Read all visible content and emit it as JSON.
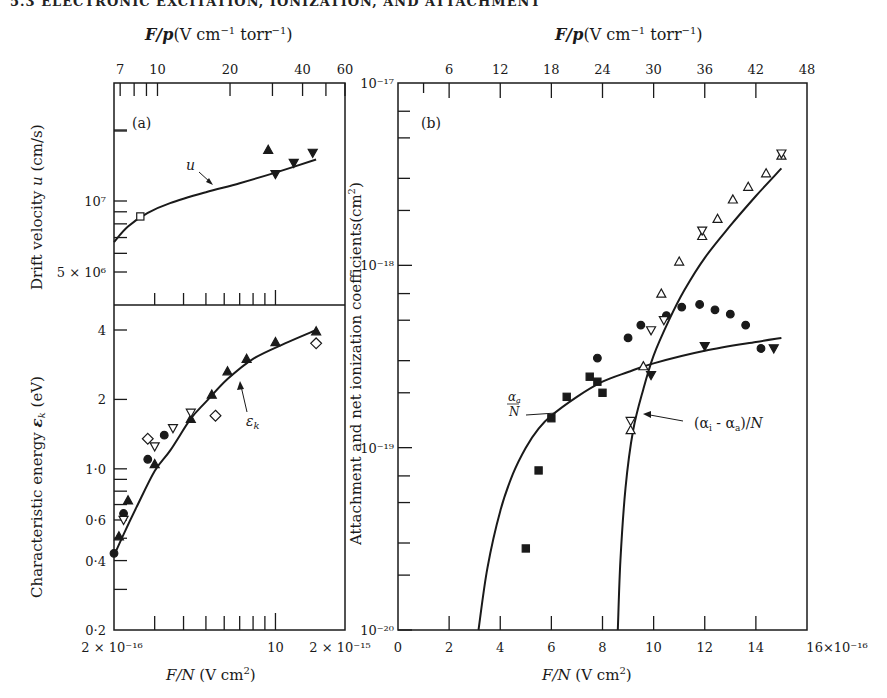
{
  "page": {
    "header_text": "5.3 ELECTRONIC EXCITATION, IONIZATION, AND ATTACHMENT"
  },
  "chart_data": [
    {
      "panel": "a-top",
      "type": "scatter",
      "label": "(a)",
      "title": "",
      "top_xlabel": "F/p (V cm⁻¹ torr⁻¹)",
      "top_xticks": [
        "7",
        "10",
        "20",
        "40",
        "60"
      ],
      "xlabel": "F/N (V cm²)",
      "xscale": "log",
      "xlim": [
        2e-16,
        2e-15
      ],
      "ylabel": "Drift velocity u (cm/s)",
      "yscale": "log",
      "yticks": [
        "5×10⁶",
        "10⁷"
      ],
      "curve_label": "u",
      "curve": {
        "name": "u",
        "x": [
          2e-16,
          2.3e-16,
          2.8e-16,
          3.5e-16,
          5e-16,
          7e-16,
          1e-15,
          1.5e-15
        ],
        "y": [
          6700000.0,
          7800000.0,
          8900000.0,
          9800000.0,
          10900000.0,
          11900000.0,
          13200000.0,
          15000000.0
        ]
      },
      "series": [
        {
          "name": "filled triangle up",
          "marker": "triangle-up-filled",
          "x": [
            9.3e-16
          ],
          "y": [
            16500000.0
          ]
        },
        {
          "name": "filled triangle down",
          "marker": "triangle-down-filled",
          "x": [
            1e-15,
            1.2e-15,
            1.45e-15
          ],
          "y": [
            13000000.0,
            14500000.0,
            16000000.0
          ]
        },
        {
          "name": "open square",
          "marker": "square-open",
          "x": [
            2.6e-16
          ],
          "y": [
            8600000.0
          ]
        }
      ]
    },
    {
      "panel": "a-bottom",
      "type": "scatter",
      "title": "",
      "xlabel": "F/N (V cm²)",
      "xscale": "log",
      "xlim": [
        2e-16,
        2e-15
      ],
      "xticks": [
        "2×10⁻¹⁶",
        "10",
        "2×10⁻¹⁵"
      ],
      "ylabel": "Characteristic energy εk (eV)",
      "yscale": "log",
      "ylim": [
        0.2,
        4.5
      ],
      "yticks": [
        "0·2",
        "0·4",
        "0·6",
        "1·0",
        "2",
        "4"
      ],
      "curve_label": "εk",
      "curve": {
        "name": "εk",
        "x": [
          2e-16,
          2.2e-16,
          2.5e-16,
          3e-16,
          3.5e-16,
          4.3e-16,
          5e-16,
          6.2e-16,
          8e-16,
          1.1e-15,
          1.5e-15
        ],
        "y": [
          0.42,
          0.52,
          0.68,
          0.98,
          1.2,
          1.65,
          1.95,
          2.45,
          3.0,
          3.5,
          4.0
        ]
      },
      "series": [
        {
          "name": "filled triangle up",
          "marker": "triangle-up-filled",
          "x": [
            2.1e-16,
            2.3e-16,
            3e-16,
            4.3e-16,
            5.3e-16,
            6.2e-16,
            7.5e-16,
            1e-15,
            1.5e-15
          ],
          "y": [
            0.51,
            0.73,
            1.05,
            1.65,
            2.1,
            2.65,
            3.0,
            3.55,
            3.95
          ]
        },
        {
          "name": "filled circle",
          "marker": "circle-filled",
          "x": [
            2e-16,
            2.2e-16,
            2.8e-16,
            3.3e-16
          ],
          "y": [
            0.43,
            0.64,
            1.1,
            1.4
          ]
        },
        {
          "name": "open triangle down",
          "marker": "triangle-down-open",
          "x": [
            2.2e-16,
            3e-16,
            3.6e-16,
            4.3e-16
          ],
          "y": [
            0.6,
            1.25,
            1.5,
            1.75
          ]
        },
        {
          "name": "open diamond",
          "marker": "diamond-open",
          "x": [
            2.8e-16,
            5.5e-16,
            1.5e-15
          ],
          "y": [
            1.35,
            1.7,
            3.5
          ]
        }
      ]
    },
    {
      "panel": "b",
      "type": "scatter",
      "label": "(b)",
      "title": "",
      "top_xlabel": "F/p (V cm⁻¹ torr⁻¹)",
      "top_xticks": [
        "6",
        "12",
        "18",
        "24",
        "30",
        "36",
        "42",
        "48"
      ],
      "xlabel": "F/N (V cm²)",
      "xscale": "linear",
      "xlim": [
        0,
        16
      ],
      "xticks": [
        "0",
        "2",
        "4",
        "6",
        "8",
        "10",
        "12",
        "14",
        "16×10⁻¹⁶"
      ],
      "ylabel": "Attachment and net ionization coefficients (cm²)",
      "yscale": "log",
      "ylim": [
        1e-20,
        1e-17
      ],
      "yticks": [
        "10⁻²⁰",
        "10⁻¹⁹",
        "10⁻¹⁸",
        "10⁻¹⁷"
      ],
      "annotations": [
        "αa/N",
        "(αi - αa)/N"
      ],
      "curves": [
        {
          "name": "αa/N",
          "x": [
            3.15,
            3.5,
            4.0,
            4.5,
            5.0,
            5.5,
            6.0,
            7.0,
            8.0,
            9.0,
            10.0,
            12.0,
            14.0,
            15.0
          ],
          "y": [
            1e-20,
            2.2e-20,
            4.5e-20,
            7.2e-20,
            1e-19,
            1.27e-19,
            1.5e-19,
            1.9e-19,
            2.3e-19,
            2.6e-19,
            2.9e-19,
            3.4e-19,
            3.8e-19,
            4e-19
          ]
        },
        {
          "name": "(αi - αa)/N",
          "x": [
            8.6,
            8.7,
            8.9,
            9.2,
            9.6,
            10.0,
            10.6,
            11.2,
            12.0,
            13.0,
            14.0,
            15.0
          ],
          "y": [
            1e-20,
            2.4e-20,
            6e-20,
            1.25e-19,
            2.1e-19,
            3.2e-19,
            5e-19,
            7.3e-19,
            1.1e-18,
            1.65e-18,
            2.4e-18,
            3.4e-18
          ]
        }
      ],
      "series": [
        {
          "name": "filled square",
          "marker": "square-filled",
          "x": [
            5.0,
            5.5,
            6.0,
            6.6,
            7.5,
            7.8,
            8.0
          ],
          "y": [
            2.8e-20,
            7.5e-20,
            1.45e-19,
            1.9e-19,
            2.45e-19,
            2.3e-19,
            2e-19
          ]
        },
        {
          "name": "filled circle",
          "marker": "circle-filled",
          "x": [
            7.8,
            9.0,
            9.5,
            10.5,
            11.1,
            11.8,
            12.4,
            13.0,
            13.6,
            14.2
          ],
          "y": [
            3.1e-19,
            4e-19,
            4.7e-19,
            5.3e-19,
            5.9e-19,
            6.1e-19,
            5.7e-19,
            5.4e-19,
            4.7e-19,
            3.5e-19
          ]
        },
        {
          "name": "filled triangle down",
          "marker": "triangle-down-filled",
          "x": [
            9.9,
            12.0,
            14.7
          ],
          "y": [
            2.5e-19,
            3.6e-19,
            3.5e-19
          ]
        },
        {
          "name": "open triangle up",
          "marker": "triangle-up-open",
          "x": [
            9.1,
            9.6,
            10.3,
            11.0,
            11.9,
            12.5,
            13.1,
            13.7,
            14.4,
            15.0
          ],
          "y": [
            1.25e-19,
            2.8e-19,
            7e-19,
            1.05e-18,
            1.45e-18,
            1.8e-18,
            2.3e-18,
            2.7e-18,
            3.2e-18,
            4e-18
          ]
        },
        {
          "name": "open triangle down",
          "marker": "triangle-down-open",
          "x": [
            9.1,
            9.9,
            10.4,
            11.9,
            15.0
          ],
          "y": [
            1.4e-19,
            4.4e-19,
            5e-19,
            1.55e-18,
            4.1e-18
          ]
        }
      ]
    }
  ],
  "labels": {
    "top_axis_left": "F/p(V cm⁻¹ torr⁻¹)",
    "top_axis_right": "F/p(V cm⁻¹ torr⁻¹)",
    "panel_a": "(a)",
    "panel_b": "(b)",
    "ylabel_drift": "Drift velocity u (cm/s)",
    "ylabel_energy": "Characteristic energy εk (eV)",
    "ylabel_attach": "Attachment and net ionization coefficients (cm²)",
    "xlabel_left": "F/N (V cm²)",
    "xlabel_right": "F/N (V cm²)",
    "curve_u": "u",
    "curve_ek": "εk",
    "annot_alpha_a": "αa/N",
    "annot_net": "(αi - αa)/N"
  }
}
